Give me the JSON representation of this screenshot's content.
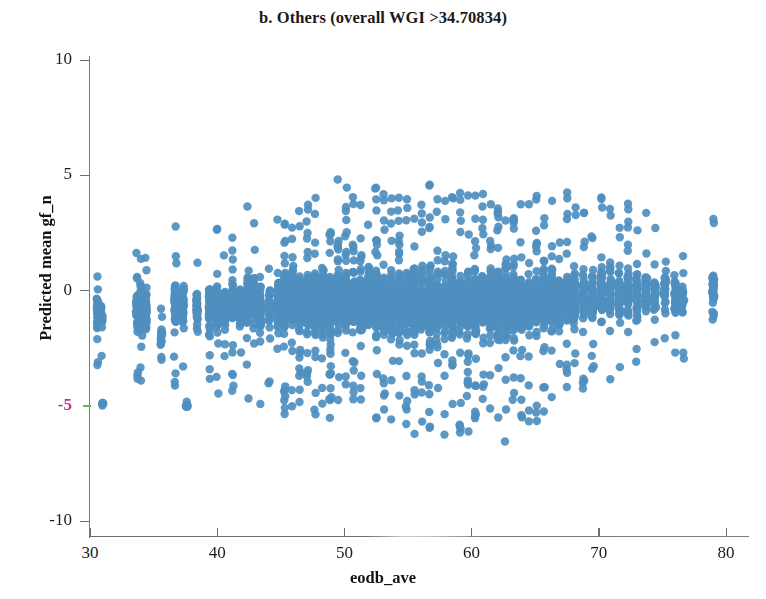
{
  "chart_data": {
    "type": "scatter",
    "title": "b. Others (overall WGI >34.70834)",
    "xlabel": "eodb_ave",
    "ylabel": "Predicted mean gf_n",
    "xlim": [
      27.5,
      83.5
    ],
    "ylim": [
      -10.8,
      10.8
    ],
    "xticks": [
      30,
      40,
      50,
      60,
      70,
      80
    ],
    "yticks": [
      10,
      5,
      0,
      -5,
      -10
    ],
    "xtick_labels": [
      "30",
      "40",
      "50",
      "60",
      "70",
      "80"
    ],
    "ytick_labels": [
      "10",
      "5",
      "0",
      "-5",
      "-10"
    ],
    "grid": false,
    "legend": null,
    "marker": {
      "shape": "circle",
      "color": "#4f8fc0",
      "edge_color": "#4f8fc0",
      "size_px": 8.4,
      "alpha": 0.92
    },
    "highlight": {
      "ytick_value": -5,
      "label_color": "#b43c8e",
      "tick_color": "#4cc14c"
    },
    "n_points_approx": 5200,
    "series": [
      {
        "name": "Others",
        "color": "#4f8fc0",
        "columns": [
          {
            "x": 30.6,
            "n": 34,
            "ylo": -3.7,
            "yhi": 1.4,
            "dense_lo": -2.6,
            "dense_hi": 0.9
          },
          {
            "x": 30.9,
            "n": 22,
            "ylo": -4.0,
            "yhi": 1.3,
            "dense_lo": -2.8,
            "dense_hi": 0.6
          },
          {
            "x": 31.0,
            "n": 8,
            "ylo": -5.0,
            "yhi": -4.7,
            "dense_lo": -5.0,
            "dense_hi": -4.8
          },
          {
            "x": 33.7,
            "n": 40,
            "ylo": -3.9,
            "yhi": 1.8,
            "dense_lo": -2.9,
            "dense_hi": 1.2
          },
          {
            "x": 34.0,
            "n": 46,
            "ylo": -4.2,
            "yhi": 2.3,
            "dense_lo": -3.0,
            "dense_hi": 1.6
          },
          {
            "x": 34.4,
            "n": 30,
            "ylo": -3.6,
            "yhi": 1.5,
            "dense_lo": -2.7,
            "dense_hi": 0.9
          },
          {
            "x": 35.6,
            "n": 18,
            "ylo": -4.6,
            "yhi": 0.4,
            "dense_lo": -3.4,
            "dense_hi": -0.3
          },
          {
            "x": 36.7,
            "n": 52,
            "ylo": -4.4,
            "yhi": 2.8,
            "dense_lo": -3.1,
            "dense_hi": 1.9
          },
          {
            "x": 37.3,
            "n": 44,
            "ylo": -4.3,
            "yhi": 2.1,
            "dense_lo": -3.0,
            "dense_hi": 1.4
          },
          {
            "x": 37.6,
            "n": 10,
            "ylo": -5.1,
            "yhi": -4.8,
            "dense_lo": -5.1,
            "dense_hi": -4.9
          },
          {
            "x": 38.4,
            "n": 36,
            "ylo": -3.8,
            "yhi": 1.9,
            "dense_lo": -2.7,
            "dense_hi": 1.2
          },
          {
            "x": 39.4,
            "n": 48,
            "ylo": -4.5,
            "yhi": 2.6,
            "dense_lo": -3.2,
            "dense_hi": 1.8
          },
          {
            "x": 40.0,
            "n": 58,
            "ylo": -4.9,
            "yhi": 3.0,
            "dense_lo": -3.4,
            "dense_hi": 2.1
          },
          {
            "x": 40.6,
            "n": 42,
            "ylo": -4.1,
            "yhi": 2.2,
            "dense_lo": -2.9,
            "dense_hi": 1.5
          },
          {
            "x": 41.2,
            "n": 50,
            "ylo": -4.4,
            "yhi": 2.7,
            "dense_lo": -3.1,
            "dense_hi": 1.9
          },
          {
            "x": 41.8,
            "n": 38,
            "ylo": -4.0,
            "yhi": 2.0,
            "dense_lo": -2.8,
            "dense_hi": 1.3
          },
          {
            "x": 42.4,
            "n": 66,
            "ylo": -4.8,
            "yhi": 6.4,
            "dense_lo": -3.3,
            "dense_hi": 2.4
          },
          {
            "x": 42.9,
            "n": 54,
            "ylo": -4.6,
            "yhi": 3.1,
            "dense_lo": -3.2,
            "dense_hi": 2.2
          },
          {
            "x": 43.4,
            "n": 46,
            "ylo": -5.3,
            "yhi": 2.5,
            "dense_lo": -3.4,
            "dense_hi": 1.7
          },
          {
            "x": 44.1,
            "n": 40,
            "ylo": -4.2,
            "yhi": 2.3,
            "dense_lo": -3.0,
            "dense_hi": 1.6
          },
          {
            "x": 44.8,
            "n": 56,
            "ylo": -4.7,
            "yhi": 3.2,
            "dense_lo": -3.3,
            "dense_hi": 2.3
          },
          {
            "x": 45.3,
            "n": 88,
            "ylo": -5.4,
            "yhi": 4.6,
            "dense_lo": -3.6,
            "dense_hi": 2.8
          },
          {
            "x": 45.9,
            "n": 96,
            "ylo": -5.6,
            "yhi": 4.2,
            "dense_lo": -3.7,
            "dense_hi": 2.7
          },
          {
            "x": 46.5,
            "n": 90,
            "ylo": -5.2,
            "yhi": 4.0,
            "dense_lo": -3.5,
            "dense_hi": 2.6
          },
          {
            "x": 47.1,
            "n": 84,
            "ylo": -5.0,
            "yhi": 3.8,
            "dense_lo": -3.4,
            "dense_hi": 2.5
          },
          {
            "x": 47.7,
            "n": 92,
            "ylo": -5.5,
            "yhi": 4.4,
            "dense_lo": -3.6,
            "dense_hi": 2.8
          },
          {
            "x": 48.3,
            "n": 86,
            "ylo": -5.1,
            "yhi": 3.9,
            "dense_lo": -3.5,
            "dense_hi": 2.6
          },
          {
            "x": 48.9,
            "n": 94,
            "ylo": -5.7,
            "yhi": 4.3,
            "dense_lo": -3.7,
            "dense_hi": 2.7
          },
          {
            "x": 49.5,
            "n": 88,
            "ylo": -5.3,
            "yhi": 5.2,
            "dense_lo": -3.6,
            "dense_hi": 2.9
          },
          {
            "x": 50.1,
            "n": 98,
            "ylo": -5.8,
            "yhi": 4.5,
            "dense_lo": -3.8,
            "dense_hi": 2.8
          },
          {
            "x": 50.7,
            "n": 90,
            "ylo": -5.4,
            "yhi": 4.1,
            "dense_lo": -3.6,
            "dense_hi": 2.7
          },
          {
            "x": 51.3,
            "n": 96,
            "ylo": -5.9,
            "yhi": 4.4,
            "dense_lo": -3.8,
            "dense_hi": 2.8
          },
          {
            "x": 51.9,
            "n": 92,
            "ylo": -5.6,
            "yhi": 4.0,
            "dense_lo": -3.7,
            "dense_hi": 2.6
          },
          {
            "x": 52.5,
            "n": 100,
            "ylo": -6.0,
            "yhi": 4.6,
            "dense_lo": -3.9,
            "dense_hi": 2.9
          },
          {
            "x": 53.1,
            "n": 94,
            "ylo": -5.7,
            "yhi": 4.2,
            "dense_lo": -3.7,
            "dense_hi": 2.7
          },
          {
            "x": 53.7,
            "n": 98,
            "ylo": -6.1,
            "yhi": 4.5,
            "dense_lo": -3.9,
            "dense_hi": 2.9
          },
          {
            "x": 54.3,
            "n": 92,
            "ylo": -5.8,
            "yhi": 4.1,
            "dense_lo": -3.8,
            "dense_hi": 2.7
          },
          {
            "x": 54.9,
            "n": 96,
            "ylo": -6.2,
            "yhi": 4.4,
            "dense_lo": -3.9,
            "dense_hi": 2.8
          },
          {
            "x": 55.5,
            "n": 102,
            "ylo": -6.3,
            "yhi": 4.8,
            "dense_lo": -4.0,
            "dense_hi": 3.0
          },
          {
            "x": 56.1,
            "n": 96,
            "ylo": -6.0,
            "yhi": 4.3,
            "dense_lo": -3.9,
            "dense_hi": 2.8
          },
          {
            "x": 56.7,
            "n": 100,
            "ylo": -6.4,
            "yhi": 4.6,
            "dense_lo": -4.0,
            "dense_hi": 2.9
          },
          {
            "x": 57.3,
            "n": 94,
            "ylo": -6.1,
            "yhi": 4.2,
            "dense_lo": -3.9,
            "dense_hi": 2.8
          },
          {
            "x": 57.9,
            "n": 98,
            "ylo": -6.5,
            "yhi": 4.5,
            "dense_lo": -4.0,
            "dense_hi": 2.9
          },
          {
            "x": 58.5,
            "n": 92,
            "ylo": -6.2,
            "yhi": 4.1,
            "dense_lo": -3.9,
            "dense_hi": 2.7
          },
          {
            "x": 59.1,
            "n": 96,
            "ylo": -6.6,
            "yhi": 5.5,
            "dense_lo": -4.0,
            "dense_hi": 3.0
          },
          {
            "x": 59.7,
            "n": 90,
            "ylo": -6.3,
            "yhi": 4.3,
            "dense_lo": -3.9,
            "dense_hi": 2.8
          },
          {
            "x": 60.3,
            "n": 94,
            "ylo": -6.7,
            "yhi": 4.6,
            "dense_lo": -4.0,
            "dense_hi": 2.9
          },
          {
            "x": 60.9,
            "n": 88,
            "ylo": -6.4,
            "yhi": 4.2,
            "dense_lo": -3.9,
            "dense_hi": 2.7
          },
          {
            "x": 61.5,
            "n": 92,
            "ylo": -6.8,
            "yhi": 4.4,
            "dense_lo": -4.0,
            "dense_hi": 2.8
          },
          {
            "x": 62.1,
            "n": 86,
            "ylo": -6.5,
            "yhi": 4.0,
            "dense_lo": -3.9,
            "dense_hi": 2.6
          },
          {
            "x": 62.7,
            "n": 90,
            "ylo": -6.9,
            "yhi": 4.3,
            "dense_lo": -4.0,
            "dense_hi": 2.8
          },
          {
            "x": 63.3,
            "n": 82,
            "ylo": -6.2,
            "yhi": 3.9,
            "dense_lo": -3.8,
            "dense_hi": 2.6
          },
          {
            "x": 63.9,
            "n": 86,
            "ylo": -6.0,
            "yhi": 4.1,
            "dense_lo": -3.8,
            "dense_hi": 2.7
          },
          {
            "x": 64.5,
            "n": 78,
            "ylo": -5.7,
            "yhi": 3.8,
            "dense_lo": -3.7,
            "dense_hi": 2.5
          },
          {
            "x": 65.1,
            "n": 82,
            "ylo": -5.9,
            "yhi": 4.2,
            "dense_lo": -3.7,
            "dense_hi": 2.7
          },
          {
            "x": 65.7,
            "n": 74,
            "ylo": -5.5,
            "yhi": 3.9,
            "dense_lo": -3.6,
            "dense_hi": 2.6
          },
          {
            "x": 66.3,
            "n": 78,
            "ylo": -5.3,
            "yhi": 4.4,
            "dense_lo": -3.5,
            "dense_hi": 2.8
          },
          {
            "x": 66.9,
            "n": 70,
            "ylo": -5.0,
            "yhi": 4.0,
            "dense_lo": -3.4,
            "dense_hi": 2.6
          },
          {
            "x": 67.5,
            "n": 66,
            "ylo": -4.8,
            "yhi": 4.3,
            "dense_lo": -3.3,
            "dense_hi": 2.7
          },
          {
            "x": 68.1,
            "n": 58,
            "ylo": -4.5,
            "yhi": 3.7,
            "dense_lo": -3.2,
            "dense_hi": 2.4
          },
          {
            "x": 68.8,
            "n": 54,
            "ylo": -4.3,
            "yhi": 3.9,
            "dense_lo": -3.1,
            "dense_hi": 2.5
          },
          {
            "x": 69.5,
            "n": 50,
            "ylo": -4.1,
            "yhi": 3.5,
            "dense_lo": -3.0,
            "dense_hi": 2.3
          },
          {
            "x": 70.2,
            "n": 52,
            "ylo": -4.2,
            "yhi": 4.1,
            "dense_lo": -3.0,
            "dense_hi": 2.6
          },
          {
            "x": 70.9,
            "n": 46,
            "ylo": -3.9,
            "yhi": 3.6,
            "dense_lo": -2.9,
            "dense_hi": 2.3
          },
          {
            "x": 71.6,
            "n": 44,
            "ylo": -3.8,
            "yhi": 3.8,
            "dense_lo": -2.8,
            "dense_hi": 2.4
          },
          {
            "x": 72.3,
            "n": 48,
            "ylo": -4.0,
            "yhi": 4.4,
            "dense_lo": -2.9,
            "dense_hi": 2.7
          },
          {
            "x": 73.0,
            "n": 42,
            "ylo": -3.7,
            "yhi": 4.0,
            "dense_lo": -2.8,
            "dense_hi": 2.5
          },
          {
            "x": 73.7,
            "n": 38,
            "ylo": -3.5,
            "yhi": 3.5,
            "dense_lo": -2.6,
            "dense_hi": 2.2
          },
          {
            "x": 74.4,
            "n": 34,
            "ylo": -3.4,
            "yhi": 3.2,
            "dense_lo": -2.5,
            "dense_hi": 2.0
          },
          {
            "x": 75.2,
            "n": 30,
            "ylo": -3.2,
            "yhi": 3.0,
            "dense_lo": -2.4,
            "dense_hi": 1.9
          },
          {
            "x": 76.0,
            "n": 36,
            "ylo": -3.6,
            "yhi": 3.4,
            "dense_lo": -2.6,
            "dense_hi": 2.1
          },
          {
            "x": 76.6,
            "n": 26,
            "ylo": -3.0,
            "yhi": 2.6,
            "dense_lo": -2.2,
            "dense_hi": 1.7
          },
          {
            "x": 79.0,
            "n": 40,
            "ylo": -3.3,
            "yhi": 3.6,
            "dense_lo": -2.4,
            "dense_hi": 2.3
          },
          {
            "x": 81.4,
            "n": 34,
            "ylo": -3.1,
            "yhi": 2.2,
            "dense_lo": -2.3,
            "dense_hi": 1.6
          }
        ]
      }
    ]
  }
}
